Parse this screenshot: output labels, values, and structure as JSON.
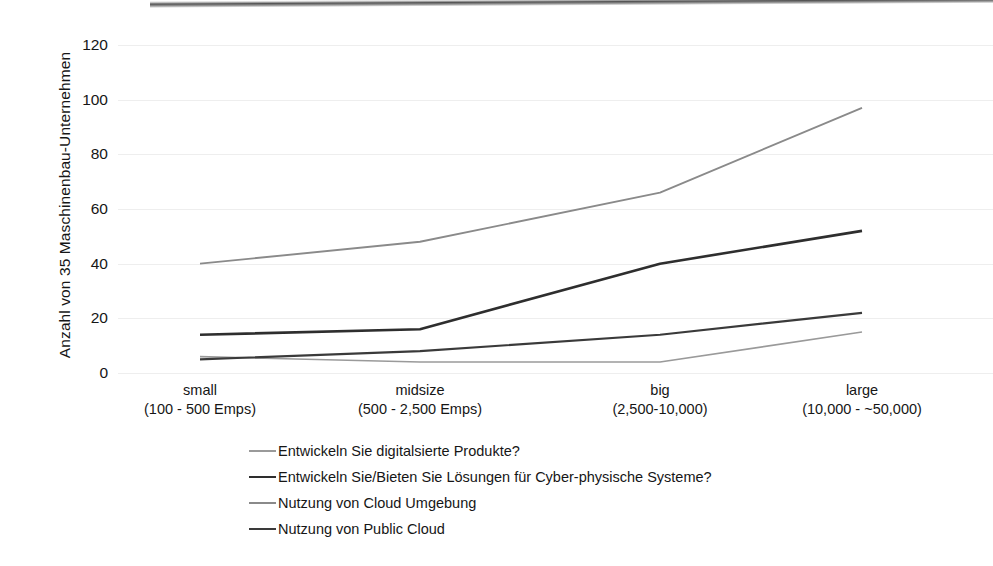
{
  "chart_data": {
    "type": "line",
    "title": "",
    "xlabel": "",
    "ylabel": "Anzahl von 35 Maschinenbau-Unternehmen",
    "categories": [
      "small",
      "midsize",
      "big",
      "large"
    ],
    "category_sublabels": [
      "(100 - 500 Emps)",
      "(500 - 2,500 Emps)",
      "(2,500-10,000)",
      "(10,000 - ~50,000)"
    ],
    "ylim": [
      0,
      130
    ],
    "yticks": [
      0,
      20,
      40,
      60,
      80,
      100,
      120
    ],
    "ytick_labels": [
      "0",
      "20",
      "40",
      "60",
      "80",
      "100",
      "120"
    ],
    "grid": true,
    "legend_position": "bottom-left",
    "series": [
      {
        "name": "Entwickeln Sie digitalsierte Produkte?",
        "values": [
          6,
          4,
          4,
          15
        ],
        "color": "#9a9a9a",
        "width": 1.6
      },
      {
        "name": "Entwickeln Sie/Bieten Sie Lösungen für Cyber-physische Systeme?",
        "values": [
          14,
          16,
          40,
          52
        ],
        "color": "#2e2e2e",
        "width": 2.6
      },
      {
        "name": "Nutzung von Cloud Umgebung",
        "values": [
          40,
          48,
          66,
          97
        ],
        "color": "#8a8a8a",
        "width": 1.9
      },
      {
        "name": "Nutzung von Public Cloud",
        "values": [
          5,
          8,
          14,
          22
        ],
        "color": "#3a3a3a",
        "width": 2.2
      }
    ]
  },
  "axis": {
    "y_title": "Anzahl von 35 Maschinenbau-Unternehmen"
  },
  "colors": {
    "gridline": "#eeeeee",
    "text": "#161616",
    "background": "#ffffff"
  }
}
